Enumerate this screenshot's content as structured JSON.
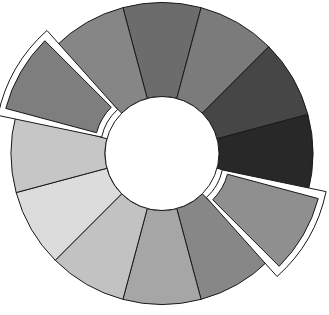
{
  "diagram": {
    "type": "segmented-ring",
    "title": "",
    "segment_count": 12,
    "segments": [
      {
        "index": 0,
        "center_angle_deg": -90,
        "color": "#6c6c6c",
        "highlighted": false
      },
      {
        "index": 1,
        "center_angle_deg": -60,
        "color": "#7b7b7b",
        "highlighted": false
      },
      {
        "index": 2,
        "center_angle_deg": -30,
        "color": "#464646",
        "highlighted": false
      },
      {
        "index": 3,
        "center_angle_deg": 0,
        "color": "#282828",
        "highlighted": false
      },
      {
        "index": 4,
        "center_angle_deg": 30,
        "color": "#8f8f8f",
        "highlighted": true
      },
      {
        "index": 5,
        "center_angle_deg": 60,
        "color": "#878787",
        "highlighted": false
      },
      {
        "index": 6,
        "center_angle_deg": 90,
        "color": "#a6a6a6",
        "highlighted": false
      },
      {
        "index": 7,
        "center_angle_deg": 120,
        "color": "#c2c2c2",
        "highlighted": false
      },
      {
        "index": 8,
        "center_angle_deg": 150,
        "color": "#dcdcdc",
        "highlighted": false
      },
      {
        "index": 9,
        "center_angle_deg": 180,
        "color": "#c6c6c6",
        "highlighted": false
      },
      {
        "index": 10,
        "center_angle_deg": 210,
        "color": "#7e7e7e",
        "highlighted": true
      },
      {
        "index": 11,
        "center_angle_deg": 240,
        "color": "#868686",
        "highlighted": false
      }
    ],
    "highlight_outline_color": "#ffffff",
    "stroke_color": "#1a1a1a"
  }
}
